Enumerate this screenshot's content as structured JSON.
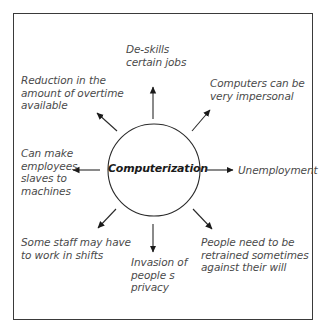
{
  "diagram": {
    "type": "mind-map",
    "center": {
      "label": "Computerization"
    },
    "effects": [
      {
        "position": "top",
        "label": "De-skills\ncertain jobs"
      },
      {
        "position": "upper-right",
        "label": "Computers can be\nvery impersonal"
      },
      {
        "position": "right",
        "label": "Unemployment"
      },
      {
        "position": "lower-right",
        "label": "People need to be\nretrained sometimes\nagainst their will"
      },
      {
        "position": "bottom",
        "label": "Invasion of\npeople s\nprivacy"
      },
      {
        "position": "lower-left",
        "label": "Some staff may have\nto work in shifts"
      },
      {
        "position": "left",
        "label": "Can make\nemployees\nslaves to\nmachines"
      },
      {
        "position": "upper-left",
        "label": "Reduction in the\namount of overtime\navailable"
      }
    ]
  },
  "colors": {
    "frame": "#3a3a3a",
    "stroke": "#2a2a2a",
    "text": "#4a4a4a",
    "center_text": "#1a1a1a",
    "background": "#ffffff"
  }
}
